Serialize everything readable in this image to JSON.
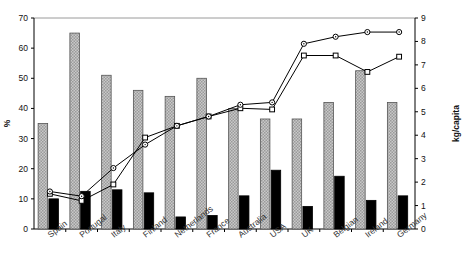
{
  "chart_data": {
    "type": "bar",
    "title": "",
    "subtitle": "",
    "xlabel": "",
    "ylabel": "%",
    "y2label": "kg/capita",
    "ylim": [
      0,
      70
    ],
    "y2lim": [
      0,
      9
    ],
    "yticks": [
      0,
      10,
      20,
      30,
      40,
      50,
      60,
      70
    ],
    "y2ticks": [
      0,
      1,
      2,
      3,
      4,
      5,
      6,
      7,
      8,
      9
    ],
    "grid": false,
    "legend": "none",
    "categories": [
      "Spain",
      "Portugal",
      "Italy",
      "Finland",
      "Netherlands",
      "France",
      "Australia",
      "USA",
      "UK",
      "Belgian",
      "Ireland",
      "Germany"
    ],
    "series": [
      {
        "name": "grey-hatched-bar",
        "kind": "bar",
        "axis": "left",
        "unit": "%",
        "color": "#b0b0b0",
        "values": [
          35,
          65,
          51,
          46,
          44,
          50,
          40,
          36.5,
          36.5,
          42,
          52.5,
          42
        ]
      },
      {
        "name": "black-bar",
        "kind": "bar",
        "axis": "left",
        "unit": "%",
        "color": "#000000",
        "values": [
          10,
          12.5,
          13,
          12,
          4,
          4.5,
          11,
          19.5,
          7.5,
          17.5,
          9.5,
          11
        ]
      },
      {
        "name": "circle-line",
        "kind": "line",
        "axis": "right",
        "unit": "kg/capita",
        "marker": "circle",
        "color": "#000000",
        "values": [
          1.6,
          1.4,
          2.6,
          3.6,
          4.4,
          4.8,
          5.3,
          5.4,
          7.9,
          8.2,
          8.4,
          8.4
        ]
      },
      {
        "name": "square-line",
        "kind": "line",
        "axis": "right",
        "unit": "kg/capita",
        "marker": "square",
        "color": "#000000",
        "values": [
          1.5,
          1.2,
          1.9,
          3.9,
          4.4,
          4.8,
          5.15,
          5.1,
          7.4,
          7.4,
          6.7,
          7.35
        ]
      }
    ]
  }
}
